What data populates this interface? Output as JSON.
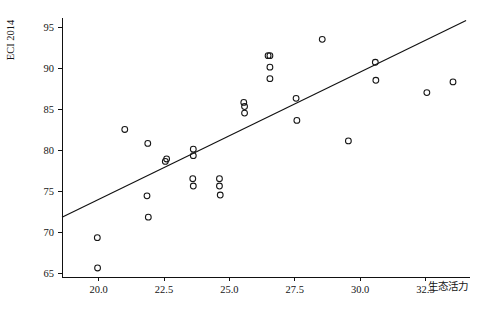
{
  "chart_data": {
    "type": "scatter",
    "title": "",
    "xlabel": "生态活力",
    "ylabel": "ECI 2014",
    "xlim": [
      18.6,
      34.2
    ],
    "ylim": [
      64.6,
      96.2
    ],
    "grid": false,
    "legend": null,
    "xticks": [
      20.0,
      22.5,
      25.0,
      27.5,
      30.0,
      32.5
    ],
    "xtick_labels": [
      "20.0",
      "22.5",
      "25.0",
      "27.5",
      "30.0",
      "32.5"
    ],
    "yticks": [
      65,
      70,
      75,
      80,
      85,
      90,
      95
    ],
    "ytick_labels": [
      "65",
      "70",
      "75",
      "80",
      "85",
      "90",
      "95"
    ],
    "marker": "open-circle",
    "marker_size": 4.2,
    "point_count": 33,
    "x": [
      19.95,
      19.96,
      21.0,
      21.9,
      21.85,
      21.9,
      22.55,
      22.6,
      23.6,
      23.62,
      23.62,
      23.65,
      24.62,
      24.62,
      24.65,
      25.55,
      25.55,
      25.58,
      26.5,
      26.52,
      26.52,
      26.55,
      27.55,
      27.6,
      28.55,
      29.55,
      30.55,
      30.6,
      32.55,
      33.55
    ],
    "y": [
      69.4,
      65.7,
      82.6,
      80.9,
      74.5,
      71.9,
      78.7,
      79.0,
      80.2,
      79.5,
      76.6,
      75.8,
      76.6,
      75.8,
      74.6,
      85.9,
      85.4,
      84.6,
      91.6,
      91.6,
      90.2,
      88.8,
      86.4,
      83.7,
      93.6,
      81.2,
      90.8,
      88.6,
      87.1,
      88.4
    ],
    "points": [
      {
        "x": 19.95,
        "y": 69.4
      },
      {
        "x": 19.96,
        "y": 65.7
      },
      {
        "x": 21.0,
        "y": 82.6
      },
      {
        "x": 21.88,
        "y": 80.9
      },
      {
        "x": 21.85,
        "y": 74.5
      },
      {
        "x": 21.9,
        "y": 71.9
      },
      {
        "x": 22.55,
        "y": 78.7
      },
      {
        "x": 22.6,
        "y": 79.0
      },
      {
        "x": 23.62,
        "y": 80.2
      },
      {
        "x": 23.62,
        "y": 79.4
      },
      {
        "x": 23.6,
        "y": 76.6
      },
      {
        "x": 23.62,
        "y": 75.7
      },
      {
        "x": 24.62,
        "y": 76.6
      },
      {
        "x": 24.62,
        "y": 75.7
      },
      {
        "x": 24.65,
        "y": 74.6
      },
      {
        "x": 25.55,
        "y": 85.9
      },
      {
        "x": 25.58,
        "y": 85.4
      },
      {
        "x": 25.58,
        "y": 84.6
      },
      {
        "x": 26.48,
        "y": 91.6
      },
      {
        "x": 26.55,
        "y": 91.6
      },
      {
        "x": 26.55,
        "y": 90.2
      },
      {
        "x": 26.55,
        "y": 88.8
      },
      {
        "x": 27.55,
        "y": 86.4
      },
      {
        "x": 27.58,
        "y": 83.7
      },
      {
        "x": 28.55,
        "y": 93.6
      },
      {
        "x": 29.55,
        "y": 81.2
      },
      {
        "x": 30.58,
        "y": 90.8
      },
      {
        "x": 30.6,
        "y": 88.6
      },
      {
        "x": 32.55,
        "y": 87.1
      },
      {
        "x": 33.55,
        "y": 88.4
      }
    ],
    "trendline": {
      "type": "linear",
      "x_start": 18.6,
      "y_start": 71.9,
      "x_end": 34.05,
      "y_end": 95.9,
      "slope": 1.553,
      "intercept": 43.02
    },
    "colors": {
      "marker_stroke": "#161616",
      "line": "#111111",
      "axis": "#111111",
      "background": "#ffffff",
      "text": "#141414"
    }
  }
}
